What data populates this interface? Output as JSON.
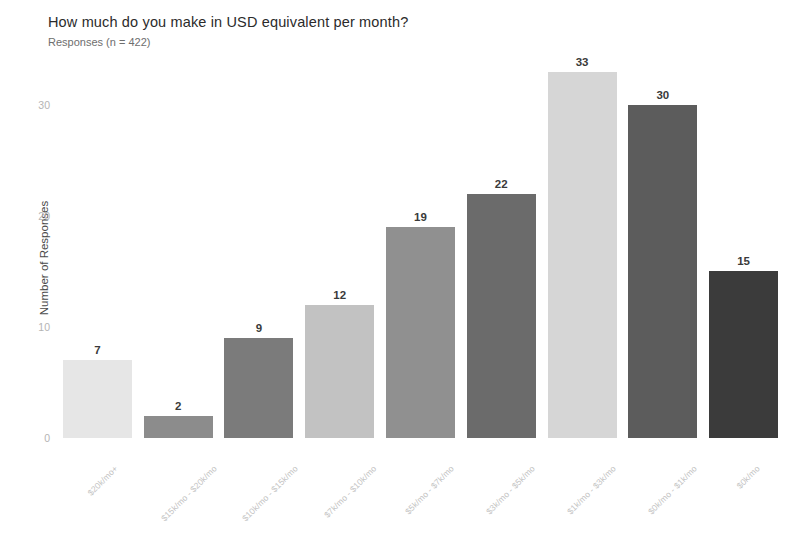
{
  "chart_data": {
    "type": "bar",
    "title": "How much do you make in USD equivalent per month?",
    "subtitle": "Responses (n = 422)",
    "xlabel": "",
    "ylabel": "Number of Responses",
    "ylim": [
      0,
      34.5
    ],
    "grid": false,
    "legend": "none",
    "y_ticks": [
      0,
      10,
      20,
      30
    ],
    "y_tick_labels": [
      "0",
      "10",
      "20",
      "30"
    ],
    "categories": [
      "$20k/mo+",
      "$15k/mo - $20k/mo",
      "$10k/mo - $15k/mo",
      "$7k/mo - $10k/mo",
      "$5k/mo - $7k/mo",
      "$3k/mo - $5k/mo",
      "$1k/mo - $3k/mo",
      "$0k/mo - $1k/mo",
      "$0k/mo"
    ],
    "values": [
      7,
      2,
      9,
      12,
      19,
      22,
      33,
      30,
      15
    ],
    "value_labels": [
      "7",
      "2",
      "9",
      "12",
      "19",
      "22",
      "33",
      "30",
      "15"
    ],
    "bar_colors": [
      "#e6e6e6",
      "#8c8c8c",
      "#7b7b7b",
      "#c2c2c2",
      "#909090",
      "#6b6b6b",
      "#d6d6d6",
      "#5c5c5c",
      "#3b3b3b"
    ]
  },
  "colors": {
    "background": "#ffffff",
    "title_text": "#2b2b2b",
    "subtitle_text": "#6e6e6e",
    "axis_title_text": "#4a4a4a",
    "tick_text": "#b4b4b4",
    "xlabel_text": "#c2c2c2",
    "value_label_text": "#3a3a3a"
  }
}
